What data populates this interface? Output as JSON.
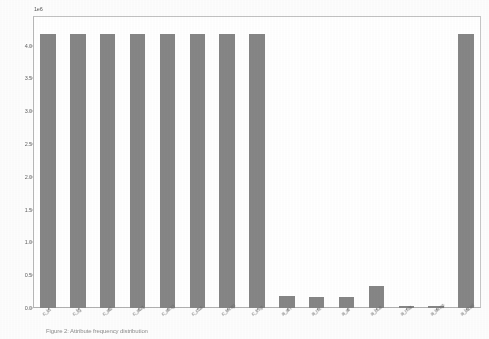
{
  "figure": {
    "background_color": "#ffffff",
    "bar_color": "#868686",
    "axis_color": "#b0b0b0",
    "tick_label_color": "#636363",
    "caption": "Figure 2: Attribute frequency distribution"
  },
  "chart_data": {
    "type": "bar",
    "title": "",
    "xlabel": "",
    "ylabel": "",
    "y_exponent_label": "1e6",
    "grid": false,
    "legend": null,
    "ylim": [
      0.0,
      4.45
    ],
    "ytick_labels": [
      "0.0",
      "0.5",
      "1.0",
      "1.5",
      "2.0",
      "2.5",
      "3.0",
      "3.5",
      "4.0"
    ],
    "ytick_values": [
      0.0,
      0.5,
      1.0,
      1.5,
      2.0,
      2.5,
      3.0,
      3.5,
      4.0
    ],
    "categories": [
      "c_id",
      "c_fg",
      "c_ad",
      "c_acq",
      "c_amg",
      "c_cca",
      "c_temp",
      "c_tmp",
      "a_an",
      "a_ns",
      "a_ar",
      "a_bus",
      "a_mla",
      "a_temp",
      "a_label"
    ],
    "values": [
      4.18,
      4.18,
      4.18,
      4.18,
      4.18,
      4.18,
      4.18,
      4.18,
      0.18,
      0.17,
      0.17,
      0.33,
      0.03,
      0.03,
      4.18
    ]
  }
}
